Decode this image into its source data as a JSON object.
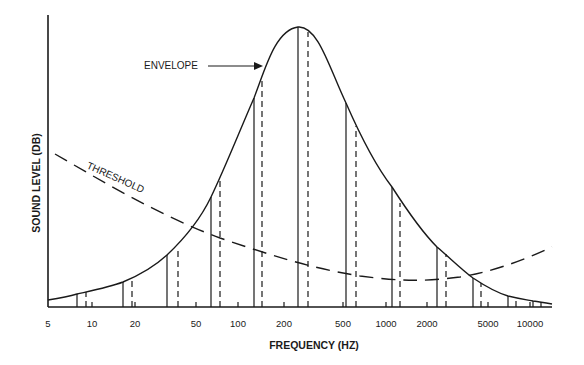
{
  "chart_data": {
    "type": "line",
    "title": "",
    "xlabel": "FREQUENCY (HZ)",
    "ylabel": "SOUND LEVEL (DB)",
    "x_scale": "log",
    "x_ticks": [
      "5",
      "10",
      "20",
      "50",
      "100",
      "200",
      "500",
      "1000",
      "2000",
      "5000",
      "10000"
    ],
    "y_ticks": [],
    "grid": false,
    "legend": null,
    "annotations": [
      {
        "text": "ENVELOPE",
        "points_to": "envelope curve (rising side, ~150 Hz)"
      },
      {
        "text": "THRESHOLD",
        "along": "dashed threshold curve"
      }
    ],
    "series": [
      {
        "name": "ENVELOPE",
        "style": "solid curve",
        "description": "Bell-shaped envelope peaking near 250 Hz",
        "x": [
          5,
          8,
          16,
          32,
          64,
          128,
          250,
          500,
          1000,
          2000,
          4000,
          8000,
          14000
        ],
        "y_relative": [
          3,
          5,
          10,
          20,
          40,
          75,
          100,
          72,
          42,
          22,
          10,
          4,
          2
        ]
      },
      {
        "name": "THRESHOLD",
        "style": "long-dashed curve",
        "description": "Hearing threshold: high at low frequencies, minimum near 1000-2000 Hz, rising at high frequencies",
        "x": [
          5,
          10,
          20,
          50,
          100,
          200,
          500,
          1000,
          2000,
          5000,
          14000
        ],
        "y_relative": [
          52,
          46,
          39,
          30,
          24,
          18,
          12,
          10,
          10,
          13,
          21
        ]
      },
      {
        "name": "Components (solid lines)",
        "style": "solid vertical lines up to envelope",
        "x_px": [
          77,
          123,
          167,
          211,
          254,
          298,
          346,
          392,
          437,
          473,
          508,
          533
        ],
        "top_px": [
          294,
          282,
          255,
          197,
          98,
          27,
          103,
          187,
          247,
          278,
          296,
          301
        ]
      },
      {
        "name": "Components (dashed lines)",
        "style": "dashed vertical lines up to envelope",
        "x_px": [
          86,
          132,
          178,
          220,
          262,
          308,
          356,
          400,
          446,
          481,
          516,
          541
        ],
        "top_px": [
          292,
          278,
          247,
          180,
          78,
          32,
          126,
          203,
          254,
          283,
          298,
          302
        ]
      }
    ]
  },
  "labels": {
    "xlabel": "FREQUENCY (HZ)",
    "ylabel": "SOUND LEVEL (DB)",
    "envelope": "ENVELOPE",
    "threshold": "THRESHOLD",
    "ticks": [
      {
        "label": "5",
        "x": 48
      },
      {
        "label": "10",
        "x": 92
      },
      {
        "label": "20",
        "x": 135
      },
      {
        "label": "50",
        "x": 196
      },
      {
        "label": "100",
        "x": 238
      },
      {
        "label": "200",
        "x": 284
      },
      {
        "label": "500",
        "x": 343
      },
      {
        "label": "1000",
        "x": 386
      },
      {
        "label": "2000",
        "x": 427
      },
      {
        "label": "5000",
        "x": 488
      },
      {
        "label": "10000",
        "x": 530
      }
    ]
  }
}
